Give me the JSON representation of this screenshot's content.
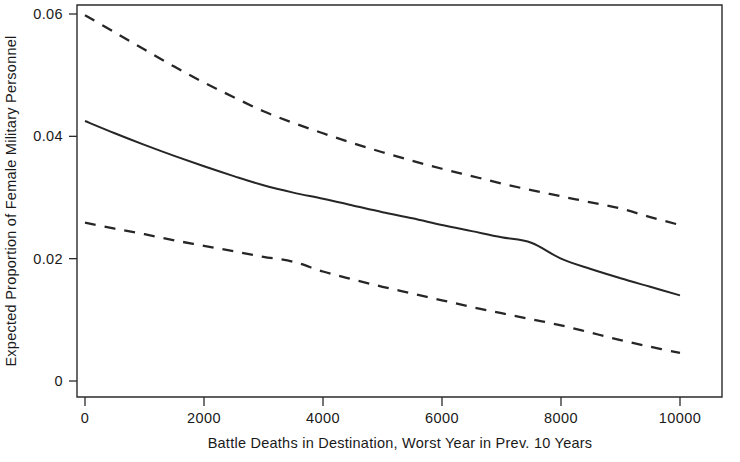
{
  "chart_data": {
    "type": "line",
    "title": "",
    "subtitle": "",
    "xlabel": "Battle Deaths in Destination, Worst Year in Prev. 10 Years",
    "ylabel": "Expected Proportion of Female Military Personnel",
    "xlim": [
      0,
      10000
    ],
    "ylim": [
      0,
      0.064
    ],
    "grid": false,
    "legend": "none",
    "xticks": [
      0,
      2000,
      4000,
      6000,
      8000,
      10000
    ],
    "xticklabels": [
      "0",
      "2000",
      "4000",
      "6000",
      "8000",
      "10000"
    ],
    "yticks": [
      0,
      0.02,
      0.04,
      0.06
    ],
    "yticklabels": [
      "0",
      "0.02",
      "0.04",
      "0.06"
    ],
    "x": [
      0,
      500,
      1000,
      1500,
      2000,
      2500,
      3000,
      3500,
      4000,
      4500,
      5000,
      5500,
      6000,
      6500,
      7000,
      7500,
      8000,
      8500,
      9000,
      9500,
      10000
    ],
    "series": [
      {
        "name": "Upper 95% Confidence Bound",
        "style": "dashed",
        "color": "#262626",
        "values": [
          0.0598,
          0.057,
          0.0542,
          0.0514,
          0.0488,
          0.0464,
          0.0441,
          0.0422,
          0.0405,
          0.0389,
          0.0374,
          0.036,
          0.0347,
          0.0335,
          0.0323,
          0.0312,
          0.0302,
          0.0292,
          0.0282,
          0.0268,
          0.0255
        ]
      },
      {
        "name": "Expected Proportion (point estimate)",
        "style": "solid",
        "color": "#262626",
        "values": [
          0.0425,
          0.0405,
          0.0386,
          0.0368,
          0.0351,
          0.0335,
          0.032,
          0.0308,
          0.0298,
          0.0287,
          0.0276,
          0.0266,
          0.0255,
          0.0245,
          0.0235,
          0.0226,
          0.02,
          0.0183,
          0.0168,
          0.0154,
          0.014
        ]
      },
      {
        "name": "Lower 95% Confidence Bound",
        "style": "dashed",
        "color": "#262626",
        "values": [
          0.0259,
          0.0249,
          0.024,
          0.023,
          0.0221,
          0.0212,
          0.0203,
          0.0195,
          0.0179,
          0.0166,
          0.0154,
          0.0143,
          0.0132,
          0.0121,
          0.0111,
          0.0101,
          0.0091,
          0.0079,
          0.0067,
          0.0056,
          0.0046
        ]
      }
    ]
  },
  "axes": {
    "y_title": "Expected Proportion of Female Military Personnel",
    "x_title": "Battle Deaths in Destination, Worst Year in Prev. 10 Years"
  }
}
